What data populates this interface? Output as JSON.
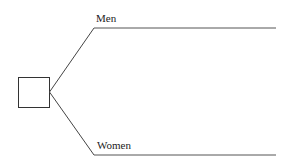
{
  "diagram": {
    "type": "decision-tree",
    "root": {
      "shape": "square",
      "label": ""
    },
    "branches": [
      {
        "label": "Men"
      },
      {
        "label": "Women"
      }
    ]
  }
}
